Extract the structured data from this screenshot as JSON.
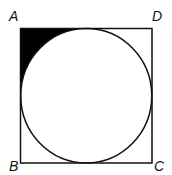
{
  "diagram": {
    "type": "geometry",
    "vertices": {
      "A": {
        "label": "A",
        "position": "top-left"
      },
      "B": {
        "label": "B",
        "position": "bottom-left"
      },
      "C": {
        "label": "C",
        "position": "bottom-right"
      },
      "D": {
        "label": "D",
        "position": "top-right"
      }
    },
    "shaded_region": "corner A",
    "colors": {
      "stroke": "#111111",
      "fill": "#000000",
      "background": "#ffffff"
    }
  }
}
